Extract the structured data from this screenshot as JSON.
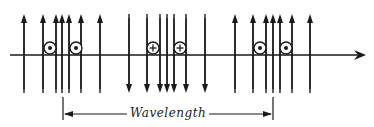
{
  "diagram": {
    "type": "electromagnetic-wave-field-lines",
    "stroke_color": "#1a1a1a",
    "background": "#ffffff",
    "axis": {
      "y": 55,
      "x_start": 10,
      "x_end": 366,
      "direction": "right"
    },
    "field_line_top": 14,
    "field_line_bottom": 93,
    "groups": [
      {
        "name": "group-left",
        "direction": "up",
        "xs": [
          24,
          43,
          56,
          62,
          69,
          81,
          100
        ]
      },
      {
        "name": "group-middle",
        "direction": "down",
        "xs": [
          129,
          147,
          160,
          167,
          174,
          186,
          205
        ]
      },
      {
        "name": "group-right",
        "direction": "up",
        "xs": [
          235,
          253,
          266,
          273,
          280,
          292,
          310
        ]
      }
    ],
    "symbols": [
      {
        "kind": "dot",
        "meaning": "field-out-of-page",
        "x": 50,
        "y": 48
      },
      {
        "kind": "dot",
        "meaning": "field-out-of-page",
        "x": 76,
        "y": 48
      },
      {
        "kind": "plus",
        "meaning": "field-into-page",
        "x": 153,
        "y": 48
      },
      {
        "kind": "plus",
        "meaning": "field-into-page",
        "x": 180,
        "y": 48
      },
      {
        "kind": "dot",
        "meaning": "field-out-of-page",
        "x": 260,
        "y": 48
      },
      {
        "kind": "dot",
        "meaning": "field-out-of-page",
        "x": 286,
        "y": 48
      }
    ],
    "wavelength": {
      "label": "Wavelength",
      "x_start": 63,
      "x_end": 273,
      "y": 114,
      "tick_top": 97,
      "tick_bottom": 120
    }
  }
}
